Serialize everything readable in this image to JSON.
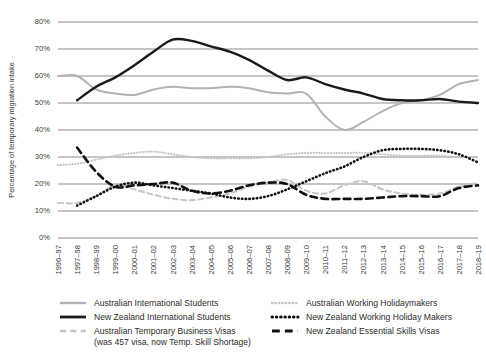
{
  "chart_data": {
    "type": "line",
    "title": "",
    "xlabel": "",
    "ylabel": "Percentage of temporary migration intake",
    "ylim": [
      0,
      80
    ],
    "ytick_labels": [
      "0%",
      "10%",
      "20%",
      "30%",
      "40%",
      "50%",
      "60%",
      "70%",
      "80%"
    ],
    "ytick_values": [
      0,
      10,
      20,
      30,
      40,
      50,
      60,
      70,
      80
    ],
    "grid": true,
    "legend_position": "bottom",
    "categories": [
      "1996–97",
      "1997–98",
      "1998–99",
      "1999–00",
      "2000–01",
      "2001–02",
      "2002–03",
      "2003–04",
      "2004–05",
      "2005–06",
      "2006–07",
      "2007–08",
      "2008–09",
      "2009–10",
      "2010–11",
      "2011–12",
      "2012–13",
      "2013–14",
      "2014–15",
      "2015–16",
      "2016–17",
      "2017–18",
      "2018–19"
    ],
    "series": [
      {
        "name": "Australian International Students",
        "style": "solid",
        "color": "#b3b3b3",
        "width": 2.0,
        "values": [
          60,
          60,
          55,
          53.5,
          53,
          55,
          56,
          55.5,
          55.5,
          56,
          55.5,
          54,
          53.5,
          53.5,
          45,
          40,
          43,
          47,
          50,
          51,
          53,
          57,
          58.5
        ]
      },
      {
        "name": "New Zealand International Students",
        "style": "solid",
        "color": "#1a1a1a",
        "width": 2.4,
        "values": [
          null,
          51,
          56,
          59.5,
          64,
          69,
          73.5,
          73,
          71,
          69,
          66,
          62,
          58.5,
          59.5,
          57,
          55,
          53.5,
          51.5,
          51,
          51,
          51.5,
          50.5,
          50
        ]
      },
      {
        "name": "Australian Temporary Business Visas (was 457 visa, now Temp. Skill Shortage)",
        "style": "dashed",
        "color": "#c6c6c6",
        "width": 2.0,
        "values": [
          13,
          13,
          15.5,
          19.5,
          18,
          16,
          14.5,
          14,
          15,
          16.5,
          19,
          20.5,
          21.5,
          17.5,
          16.5,
          19.5,
          21,
          18,
          16.5,
          16,
          16.5,
          19,
          20.5
        ]
      },
      {
        "name": "Australian Working Holidaymakers",
        "style": "dotted",
        "color": "#c4c4c4",
        "width": 2.0,
        "values": [
          27,
          27.5,
          29,
          30.5,
          31.5,
          32,
          31,
          30,
          29.5,
          29.5,
          29.5,
          30,
          31,
          31.5,
          31.5,
          31.5,
          31.5,
          31,
          30.5,
          30.5,
          30.5,
          30,
          30
        ]
      },
      {
        "name": "New Zealand Working Holiday Makers",
        "style": "dotted",
        "color": "#111111",
        "width": 2.6,
        "values": [
          null,
          12,
          15.5,
          19,
          20.5,
          19.5,
          18.5,
          17.5,
          16.5,
          15,
          14.5,
          15.5,
          18,
          21,
          24,
          26.5,
          30,
          32.5,
          33,
          33,
          32.5,
          31,
          28
        ]
      },
      {
        "name": "New Zealand Essential Skills Visas",
        "style": "dashed",
        "color": "#111111",
        "width": 2.6,
        "values": [
          null,
          33.5,
          24.5,
          19,
          19.5,
          20,
          20.5,
          17.5,
          16.5,
          17.5,
          19.5,
          20.5,
          20,
          16,
          14.5,
          14.5,
          14.5,
          15,
          15.5,
          15.5,
          15.5,
          18.5,
          19.5
        ]
      }
    ],
    "legend_column_left": [
      "Australian International Students",
      "New Zealand International Students",
      "Australian Temporary Business Visas",
      "(was 457 visa, now Temp. Skill Shortage)"
    ],
    "legend_column_right": [
      "Australian Working Holidaymakers",
      "New Zealand Working Holiday Makers",
      "New Zealand Essential Skills Visas"
    ]
  }
}
